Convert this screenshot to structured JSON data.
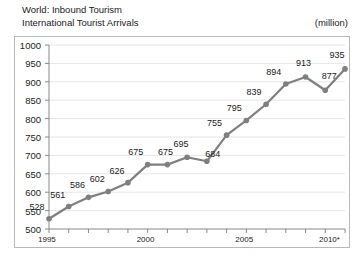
{
  "header": {
    "title_line1": "World: Inbound Tourism",
    "title_line2": "International Tourist Arrivals",
    "unit": "(million)"
  },
  "chart_data": {
    "type": "line",
    "title": "World: Inbound Tourism International Tourist Arrivals",
    "subtitle": "(million)",
    "xlabel": "",
    "ylabel": "",
    "unit": "million",
    "categories": [
      "1995",
      "1996",
      "1997",
      "1998",
      "1999",
      "2000",
      "2001",
      "2002",
      "2003",
      "2004",
      "2005",
      "2006",
      "2007",
      "2008",
      "2009",
      "2010*"
    ],
    "x": [
      1995,
      1996,
      1997,
      1998,
      1999,
      2000,
      2001,
      2002,
      2003,
      2004,
      2005,
      2006,
      2007,
      2008,
      2009,
      2010
    ],
    "values": [
      528,
      561,
      586,
      602,
      626,
      675,
      675,
      695,
      684,
      755,
      795,
      839,
      894,
      913,
      877,
      935
    ],
    "data_labels": [
      "528",
      "561",
      "586",
      "602",
      "626",
      "675",
      "675",
      "695",
      "684",
      "755",
      "795",
      "839",
      "894",
      "913",
      "877",
      "935"
    ],
    "xlim": [
      1995,
      2010
    ],
    "ylim": [
      500,
      1000
    ],
    "yticks": [
      500,
      550,
      600,
      650,
      700,
      750,
      800,
      850,
      900,
      950,
      1000
    ],
    "ytick_labels": [
      "500",
      "550",
      "600",
      "650",
      "700",
      "750",
      "800",
      "850",
      "900",
      "950",
      "1000"
    ],
    "xtick_labels_shown": [
      "1995",
      "2000",
      "2005",
      "2010*"
    ],
    "xticks_shown_at": [
      1995,
      2000,
      2005,
      2010
    ],
    "grid": "horizontal",
    "legend": "none",
    "series_color": "#7f7f7f",
    "marker": "circle",
    "footnote_marker": "*"
  }
}
